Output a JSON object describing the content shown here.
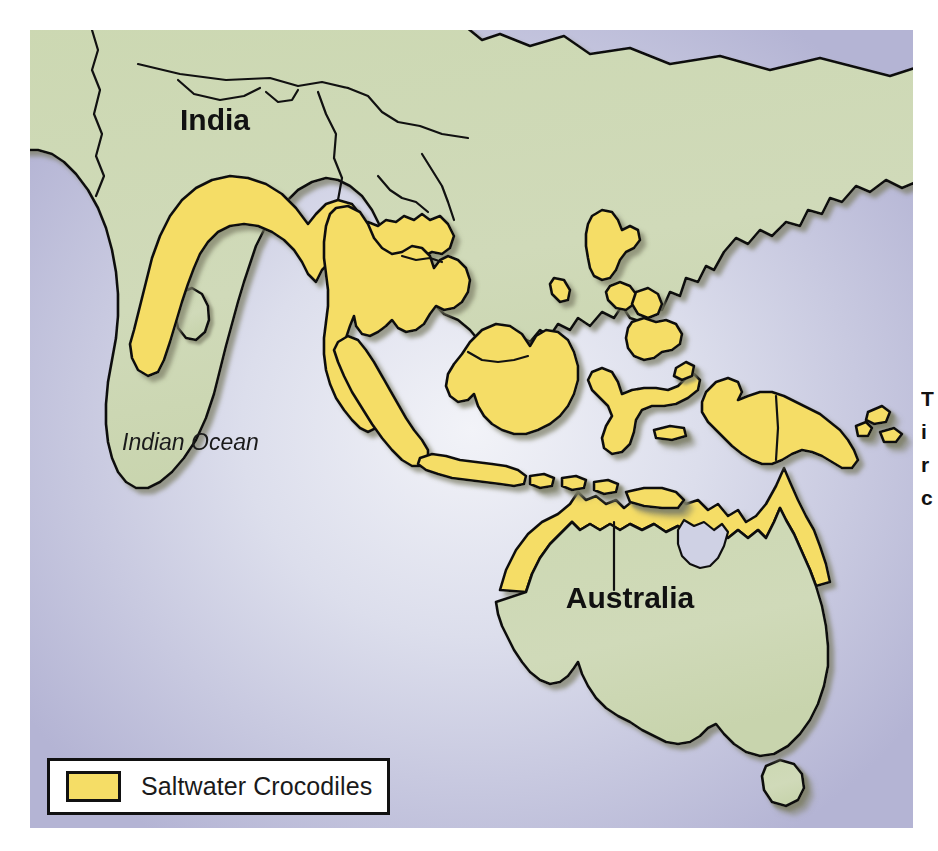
{
  "figure": {
    "type": "distribution-range-map",
    "subject": "Saltwater Crocodiles",
    "region": "South Asia, Southeast Asia, New Guinea and Australia"
  },
  "map": {
    "labels": [
      {
        "name": "india-label",
        "text": "India",
        "style": "bold",
        "x": 150,
        "y": 100
      },
      {
        "name": "indian-ocean-label",
        "text": "Indian Ocean",
        "style": "italic",
        "x": 92,
        "y": 420
      },
      {
        "name": "australia-label",
        "text": "Australia",
        "style": "bold",
        "x": 600,
        "y": 578
      }
    ],
    "colors": {
      "ocean": "#b9b9d9",
      "land": "#cdd9b5",
      "range_fill": "#f5dd66",
      "coastline": "#111111",
      "shadow": "#8f9079",
      "ocean_highlight": "#eef0f7"
    }
  },
  "legend": {
    "label": "Saltwater Crocodiles",
    "swatch_color": "#f5dd66"
  },
  "side_caption": {
    "lines": [
      "T",
      "i",
      "r",
      "c"
    ]
  },
  "chart_data": {
    "type": "map",
    "title": "Saltwater Crocodiles",
    "legend": [
      {
        "label": "Saltwater Crocodiles",
        "color": "#f5dd66"
      }
    ],
    "labels": [
      "India",
      "Indian Ocean",
      "Australia"
    ],
    "regions_shaded": [
      "Eastern India coast",
      "Bangladesh",
      "Myanmar",
      "Thailand",
      "Cambodia",
      "Vietnam",
      "Malay Peninsula",
      "Sumatra",
      "Java",
      "Borneo",
      "Sulawesi",
      "Philippines",
      "Lesser Sunda Islands",
      "New Guinea",
      "Northern Australia coast"
    ]
  }
}
